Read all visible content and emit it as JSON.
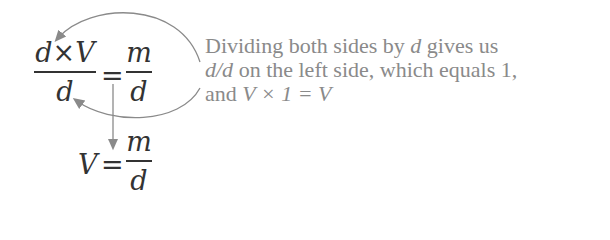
{
  "equation1": {
    "left_numerator": "d×V",
    "left_denominator": "d",
    "equals": "=",
    "right_numerator": "m",
    "right_denominator": "d"
  },
  "equation2": {
    "left": "V",
    "equals": "=",
    "right_numerator": "m",
    "right_denominator": "d"
  },
  "annotation": {
    "line1_a": "Dividing both sides by ",
    "line1_var": "d",
    "line1_b": " gives us",
    "line2_var": "d/d",
    "line2_b": " on the left side, which equals 1,",
    "line3_a": "and ",
    "line3_math": "V × 1 = V"
  },
  "colors": {
    "math_text": "#333333",
    "annotation_text": "#8a8a8a",
    "arrows": "#8a8a8a"
  }
}
